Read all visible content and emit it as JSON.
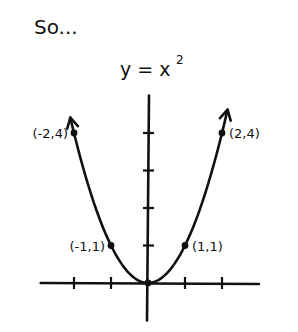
{
  "intro_text": "So...",
  "title": {
    "lhs": "y = x",
    "exponent": "2"
  },
  "chart_data": {
    "type": "line",
    "function": "y = x^2",
    "xlabel": "",
    "ylabel": "",
    "xlim": [
      -2.9,
      3.0
    ],
    "ylim": [
      -1.0,
      5.0
    ],
    "x_ticks": [
      -2,
      -1,
      1,
      2
    ],
    "y_ticks": [
      1,
      2,
      3,
      4
    ],
    "grid": false,
    "curve_x_range": [
      -2.1,
      2.15
    ],
    "arrows_on_curve_ends": true,
    "points": [
      {
        "x": -2,
        "y": 4,
        "label": "(-2,4)"
      },
      {
        "x": -1,
        "y": 1,
        "label": "(-1,1)"
      },
      {
        "x": 0,
        "y": 0,
        "label": ""
      },
      {
        "x": 1,
        "y": 1,
        "label": "(1,1)"
      },
      {
        "x": 2,
        "y": 4,
        "label": "(2,4)"
      }
    ]
  },
  "colors": {
    "ink": "#111111",
    "background": "#ffffff"
  }
}
